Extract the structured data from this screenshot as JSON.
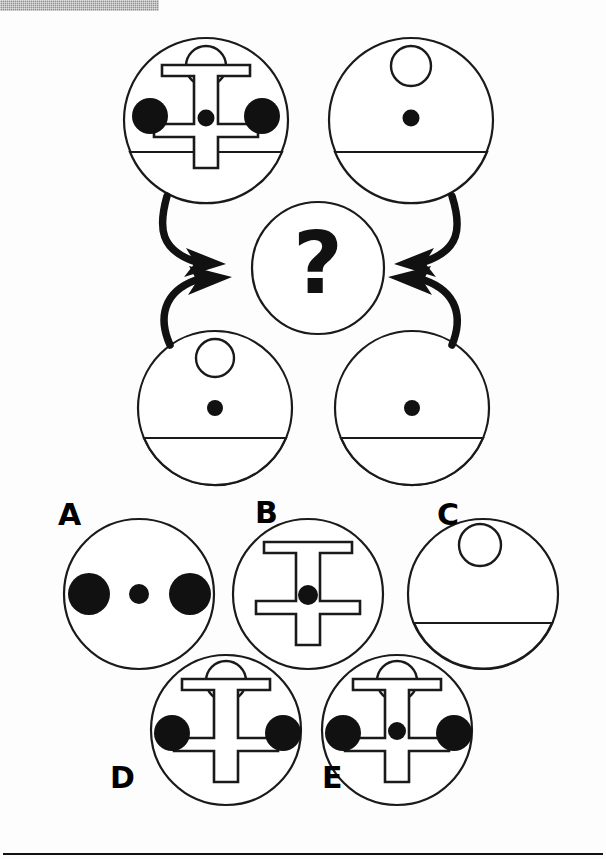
{
  "page": {
    "type": "nonverbal-reasoning-item",
    "background_color": "#fdfdfd",
    "ink_color": "#000000",
    "header_bar": {
      "name": "page-header-band",
      "color": "#8f8f8f",
      "x": 0,
      "y": 0,
      "width": 159,
      "height": 11
    },
    "bottom_rule": {
      "name": "footer-rule",
      "color": "#111111",
      "x": 3,
      "y": 853,
      "width": 600,
      "thickness": 2
    }
  },
  "prompt": {
    "question_mark": "?",
    "instruction_implied": "Which option completes the set?"
  },
  "matrix": {
    "name": "stimulus-matrix",
    "cells": [
      {
        "id": "top-left",
        "position": "top-left",
        "cx": 206,
        "cy": 120,
        "r": 82,
        "features": {
          "top_ring": true,
          "ibeam": true,
          "left_dot": true,
          "right_dot": true,
          "center_dot": true,
          "bottom_bowl": true
        }
      },
      {
        "id": "top-right",
        "position": "top-right",
        "cx": 411,
        "cy": 120,
        "r": 82,
        "features": {
          "top_ring": true,
          "ibeam": false,
          "left_dot": false,
          "right_dot": false,
          "center_dot": true,
          "bottom_bowl": true
        }
      },
      {
        "id": "bottom-left",
        "position": "bottom-left",
        "cx": 215,
        "cy": 408,
        "r": 77,
        "features": {
          "top_ring": true,
          "ibeam": false,
          "left_dot": false,
          "right_dot": false,
          "center_dot": true,
          "bottom_bowl": true
        }
      },
      {
        "id": "bottom-right",
        "position": "bottom-right",
        "cx": 412,
        "cy": 408,
        "r": 77,
        "features": {
          "top_ring": false,
          "ibeam": false,
          "left_dot": false,
          "right_dot": false,
          "center_dot": true,
          "bottom_bowl": true
        }
      }
    ],
    "center_cell": {
      "id": "answer-slot",
      "cx": 318,
      "cy": 268,
      "r": 66,
      "glyph": "?"
    },
    "arrows": [
      {
        "id": "arrow-top-left",
        "from": "top-left",
        "to": "answer-slot",
        "direction": "right"
      },
      {
        "id": "arrow-bottom-left",
        "from": "bottom-left",
        "to": "answer-slot",
        "direction": "right"
      },
      {
        "id": "arrow-top-right",
        "from": "top-right",
        "to": "answer-slot",
        "direction": "left"
      },
      {
        "id": "arrow-bottom-right",
        "from": "bottom-right",
        "to": "answer-slot",
        "direction": "left"
      }
    ]
  },
  "options": [
    {
      "label": "A",
      "id": "option-a",
      "cx": 139,
      "cy": 594,
      "r": 75,
      "features": {
        "top_ring": false,
        "ibeam": false,
        "left_dot": true,
        "right_dot": true,
        "center_dot": true,
        "bottom_bowl": false
      }
    },
    {
      "label": "B",
      "id": "option-b",
      "cx": 308,
      "cy": 594,
      "r": 75,
      "features": {
        "top_ring": false,
        "ibeam": true,
        "left_dot": false,
        "right_dot": false,
        "center_dot": true,
        "bottom_bowl": false
      }
    },
    {
      "label": "C",
      "id": "option-c",
      "cx": 483,
      "cy": 594,
      "r": 75,
      "features": {
        "top_ring": true,
        "ibeam": false,
        "left_dot": false,
        "right_dot": false,
        "center_dot": false,
        "bottom_bowl": true
      }
    },
    {
      "label": "D",
      "id": "option-d",
      "cx": 226,
      "cy": 730,
      "r": 75,
      "features": {
        "top_ring": true,
        "ibeam": true,
        "left_dot": true,
        "right_dot": true,
        "center_dot": false,
        "bottom_bowl": false
      }
    },
    {
      "label": "E",
      "id": "option-e",
      "cx": 397,
      "cy": 730,
      "r": 75,
      "features": {
        "top_ring": true,
        "ibeam": true,
        "left_dot": true,
        "right_dot": true,
        "center_dot": true,
        "bottom_bowl": false
      }
    }
  ],
  "labels": {
    "a": "A",
    "b": "B",
    "c": "C",
    "d": "D",
    "e": "E"
  }
}
